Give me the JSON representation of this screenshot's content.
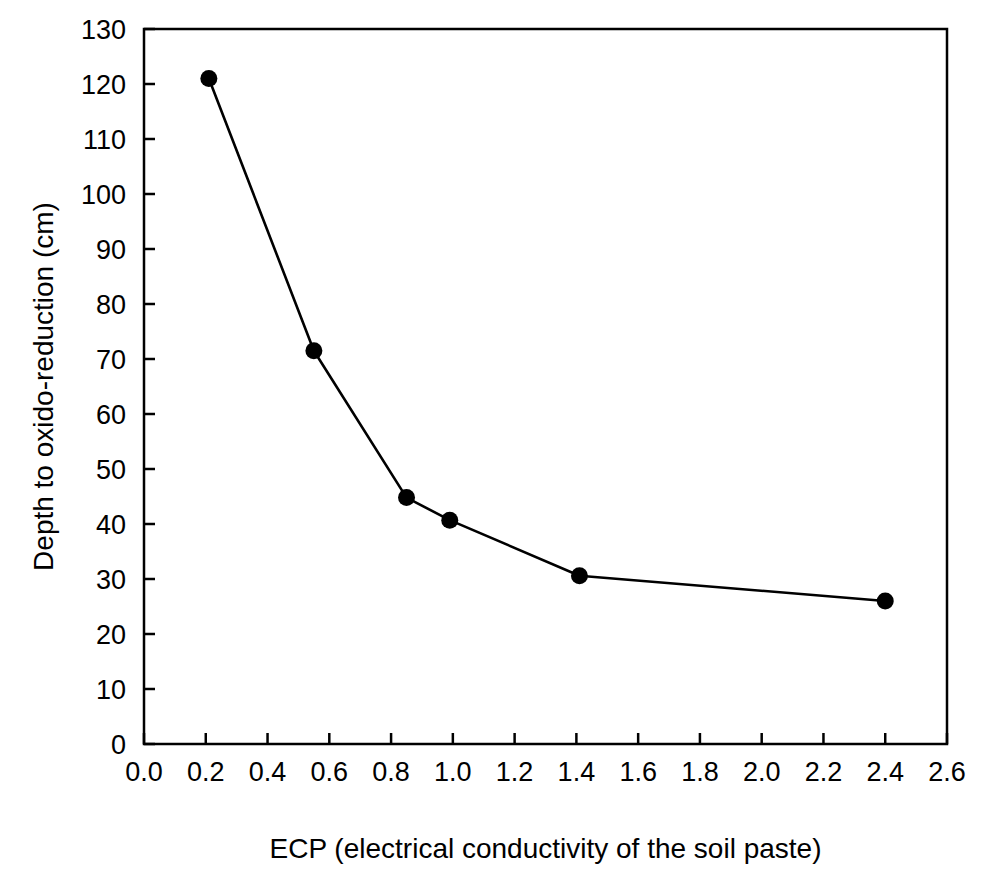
{
  "chart_data": {
    "type": "line",
    "title": "",
    "subtitle": "",
    "xlabel": "ECP (electrical conductivity of the soil paste)",
    "ylabel": "Depth to oxido-reduction (cm)",
    "xlim": [
      0.0,
      2.6
    ],
    "ylim": [
      0,
      130
    ],
    "xticks": [
      "0.0",
      "0.2",
      "0.4",
      "0.6",
      "0.8",
      "1.0",
      "1.2",
      "1.4",
      "1.6",
      "1.8",
      "2.0",
      "2.2",
      "2.4",
      "2.6"
    ],
    "xtick_values": [
      0.0,
      0.2,
      0.4,
      0.6,
      0.8,
      1.0,
      1.2,
      1.4,
      1.6,
      1.8,
      2.0,
      2.2,
      2.4,
      2.6
    ],
    "yticks": [
      "0",
      "10",
      "20",
      "30",
      "40",
      "50",
      "60",
      "70",
      "80",
      "90",
      "100",
      "110",
      "120",
      "130"
    ],
    "ytick_values": [
      0,
      10,
      20,
      30,
      40,
      50,
      60,
      70,
      80,
      90,
      100,
      110,
      120,
      130
    ],
    "grid": false,
    "legend": null,
    "marker": "filled-circle",
    "marker_color": "#000000",
    "line_color": "#000000",
    "series": [
      {
        "name": "Depth to oxido-reduction",
        "x": [
          0.21,
          0.55,
          0.85,
          0.99,
          1.41,
          2.4
        ],
        "values": [
          121,
          71.5,
          44.8,
          40.7,
          30.6,
          26.0
        ]
      }
    ],
    "annotations": []
  }
}
